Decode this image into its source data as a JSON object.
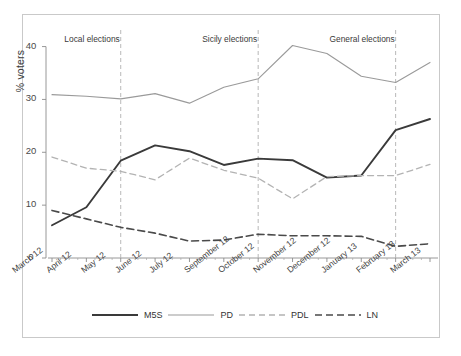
{
  "chart_data": {
    "type": "line",
    "title": "",
    "xlabel": "",
    "ylabel": "% voters",
    "ylim": [
      0,
      42
    ],
    "yticks": [
      0,
      10,
      20,
      30,
      40
    ],
    "grid": false,
    "legend_position": "bottom",
    "categories": [
      "March 12",
      "April 12",
      "May 12",
      "June 12",
      "July 12",
      "September 12",
      "October 12",
      "November 12",
      "December 12",
      "January 13",
      "February 13",
      "March 13"
    ],
    "series": [
      {
        "name": "M5S",
        "color": "#3a3a3a",
        "style": "solid",
        "width": 1.9,
        "values": [
          6.2,
          9.6,
          18.4,
          21.3,
          20.2,
          17.6,
          18.8,
          18.5,
          15.2,
          15.6,
          24.2,
          26.3
        ]
      },
      {
        "name": "PD",
        "color": "#9a9a9a",
        "style": "solid",
        "width": 1.1,
        "values": [
          30.9,
          30.6,
          30.1,
          31.1,
          29.3,
          32.3,
          33.9,
          40.2,
          38.7,
          34.4,
          33.2,
          37.0
        ]
      },
      {
        "name": "PDL",
        "color": "#b3b3b3",
        "style": "dashed",
        "width": 1.3,
        "values": [
          19.1,
          17.0,
          16.4,
          14.8,
          18.9,
          16.6,
          15.1,
          11.2,
          15.4,
          15.6,
          15.6,
          17.7
        ]
      },
      {
        "name": "LN",
        "color": "#4a4a4a",
        "style": "dashed",
        "width": 1.6,
        "values": [
          9.0,
          7.4,
          5.8,
          4.7,
          3.2,
          3.4,
          4.5,
          4.2,
          4.2,
          4.1,
          2.2,
          2.7
        ]
      }
    ],
    "annotations": [
      {
        "label": "Local elections",
        "at": "May 12"
      },
      {
        "label": "Sicily elections",
        "at": "October 12"
      },
      {
        "label": "General elections",
        "at": "February 13"
      }
    ]
  },
  "legend": {
    "items": [
      {
        "label": "M5S"
      },
      {
        "label": "PD"
      },
      {
        "label": "PDL"
      },
      {
        "label": "LN"
      }
    ]
  }
}
